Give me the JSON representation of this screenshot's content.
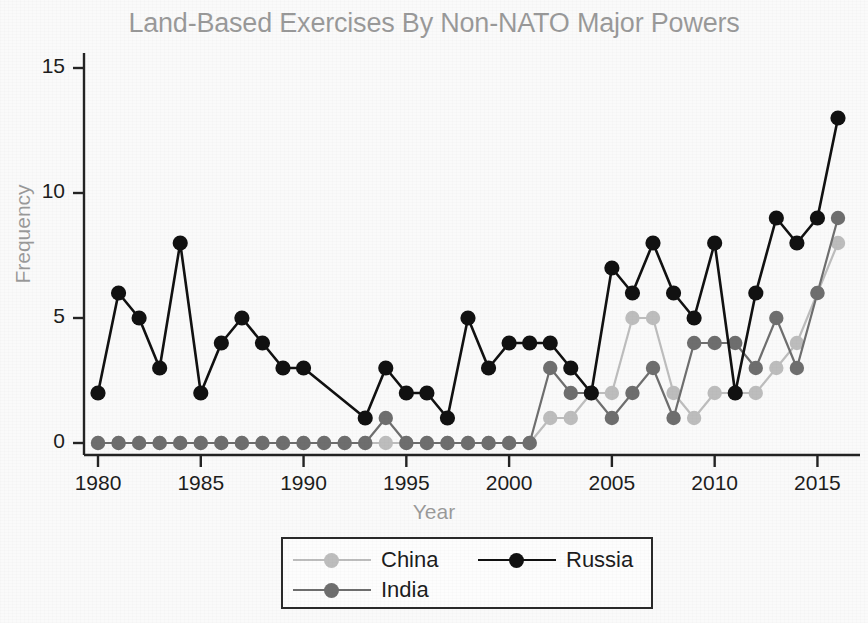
{
  "chart_data": {
    "type": "line",
    "title": "Land-Based Exercises By Non-NATO Major Powers",
    "xlabel": "Year",
    "ylabel": "Frequency",
    "xlim": [
      1979.2,
      1916.8
    ],
    "x_range": [
      1979.2,
      1916.8
    ],
    "ylim": [
      0,
      15.6
    ],
    "grid": false,
    "legend_position": "bottom-center",
    "x": [
      1980,
      1981,
      1982,
      1983,
      1984,
      1985,
      1986,
      1987,
      1988,
      1989,
      1990,
      1991,
      1992,
      1993,
      1994,
      1995,
      1996,
      1997,
      1998,
      1999,
      2000,
      2001,
      2002,
      2003,
      2004,
      2005,
      2006,
      2007,
      2008,
      2009,
      2010,
      2011,
      2012,
      2013,
      2014,
      2015,
      2016
    ],
    "xticks": [
      1980,
      1985,
      1990,
      1995,
      2000,
      2005,
      2010,
      2015
    ],
    "xticklabels": [
      "1980",
      "1985",
      "1990",
      "1995",
      "2000",
      "2005",
      "2010",
      "2015"
    ],
    "yticks": [
      0,
      5,
      10,
      15
    ],
    "yticklabels": [
      "0",
      "5",
      "10",
      "15"
    ],
    "series": [
      {
        "name": "China",
        "color": "#bdbdbd",
        "marker": "circle",
        "values": [
          0,
          0,
          0,
          0,
          0,
          0,
          0,
          0,
          0,
          0,
          0,
          0,
          0,
          0,
          0,
          0,
          0,
          0,
          0,
          0,
          0,
          0,
          1,
          1,
          2,
          2,
          5,
          5,
          2,
          1,
          2,
          2,
          2,
          3,
          4,
          6,
          8
        ]
      },
      {
        "name": "India",
        "color": "#6e6e6e",
        "marker": "circle",
        "values": [
          0,
          0,
          0,
          0,
          0,
          0,
          0,
          0,
          0,
          0,
          0,
          0,
          0,
          0,
          1,
          0,
          0,
          0,
          0,
          0,
          0,
          0,
          3,
          2,
          2,
          1,
          2,
          3,
          1,
          4,
          4,
          4,
          3,
          5,
          3,
          6,
          9
        ]
      },
      {
        "name": "Russia",
        "color": "#111111",
        "marker": "circle",
        "values": [
          2,
          6,
          5,
          3,
          8,
          2,
          4,
          5,
          4,
          3,
          3,
          null,
          null,
          1,
          3,
          2,
          2,
          1,
          5,
          3,
          4,
          4,
          4,
          3,
          2,
          7,
          6,
          8,
          6,
          5,
          8,
          2,
          6,
          9,
          8,
          9,
          13
        ]
      }
    ]
  },
  "legend": {
    "entries": [
      {
        "label": "China"
      },
      {
        "label": "India"
      },
      {
        "label": "Russia"
      }
    ]
  }
}
